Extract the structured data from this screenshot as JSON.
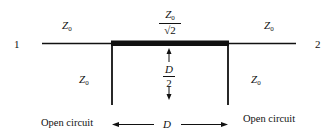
{
  "diagram": {
    "type": "transmission-line-circuit",
    "ports": {
      "left": "1",
      "right": "2"
    },
    "labels": {
      "left_line": {
        "symbol": "Z",
        "subscript": "0"
      },
      "right_line": {
        "symbol": "Z",
        "subscript": "0"
      },
      "center_line": {
        "numerator_symbol": "Z",
        "numerator_subscript": "0",
        "denominator": "√2"
      },
      "left_stub": {
        "symbol": "Z",
        "subscript": "0"
      },
      "right_stub": {
        "symbol": "Z",
        "subscript": "0"
      },
      "stub_length": {
        "numerator": "D",
        "denominator": "2"
      },
      "spacing": "D",
      "left_termination": "Open circuit",
      "right_termination": "Open circuit"
    },
    "colors": {
      "line": "#111111",
      "background": "#ffffff"
    }
  }
}
